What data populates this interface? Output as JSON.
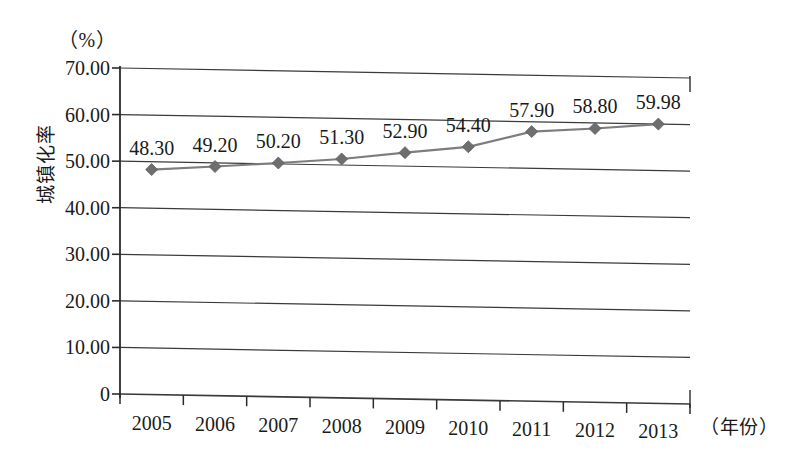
{
  "chart_data": {
    "type": "line",
    "title": "",
    "subtitle": "",
    "xlabel": "（年份）",
    "ylabel": "城镇化率",
    "unit_label": "（%）",
    "categories": [
      "2005",
      "2006",
      "2007",
      "2008",
      "2009",
      "2010",
      "2011",
      "2012",
      "2013"
    ],
    "values": [
      48.3,
      49.2,
      50.2,
      51.3,
      52.9,
      54.4,
      57.9,
      58.8,
      59.98
    ],
    "data_labels": [
      "48.30",
      "49.20",
      "50.20",
      "51.30",
      "52.90",
      "54.40",
      "57.90",
      "58.80",
      "59.98"
    ],
    "ylim": [
      0,
      70
    ],
    "ytick_values": [
      0,
      10,
      20,
      30,
      40,
      50,
      60,
      70
    ],
    "ytick_labels": [
      "0",
      "10.00",
      "20.00",
      "30.00",
      "40.00",
      "50.00",
      "60.00",
      "70.00"
    ],
    "grid": true,
    "grid_axis": "y",
    "legend": false,
    "legend_position": "none",
    "series": [
      {
        "name": "城镇化率",
        "values": [
          48.3,
          49.2,
          50.2,
          51.3,
          52.9,
          54.4,
          57.9,
          58.8,
          59.98
        ],
        "marker": "diamond",
        "line_color": "#7d7d7d",
        "marker_color": "#6e6e6e"
      }
    ]
  },
  "colors": {
    "axis": "#2b2b2b",
    "gridline": "#3a3a3a",
    "series_line": "#7d7d7d",
    "series_marker": "#6e6e6e",
    "text": "#1a1a1a",
    "background": "#ffffff"
  }
}
